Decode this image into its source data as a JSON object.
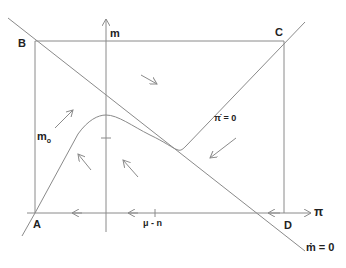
{
  "diagram": {
    "type": "phase-diagram",
    "axes": {
      "vertical_label": "m",
      "horizontal_label": "π"
    },
    "corners": {
      "top_left": "B",
      "top_right": "C",
      "bottom_left": "A",
      "bottom_right": "D"
    },
    "ticks": {
      "vertical_tick_label_main": "m",
      "vertical_tick_label_sub": "o",
      "horizontal_tick_label": "μ - n"
    },
    "loci": {
      "pi_dot_zero": "π̇ = 0",
      "m_dot_zero": "ṁ = 0"
    },
    "colors": {
      "line": "#8a8a8a",
      "text": "#222222",
      "background": "#ffffff"
    }
  }
}
